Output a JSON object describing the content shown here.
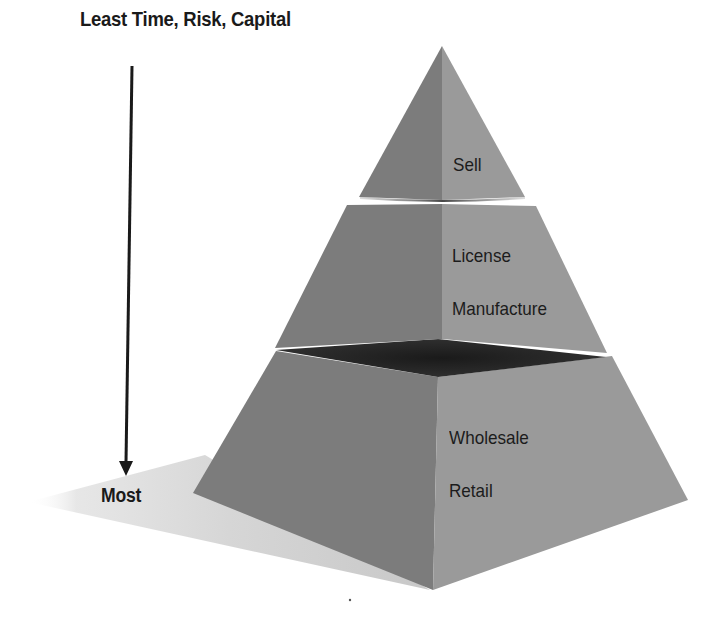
{
  "diagram": {
    "type": "pyramid",
    "axis": {
      "top_label": "Least Time, Risk, Capital",
      "bottom_label": "Most",
      "direction": "down"
    },
    "tiers": [
      {
        "position": "top",
        "labels": [
          "Sell"
        ]
      },
      {
        "position": "middle",
        "labels": [
          "License",
          "Manufacture"
        ]
      },
      {
        "position": "bottom",
        "labels": [
          "Wholesale",
          "Retail"
        ]
      }
    ],
    "colors": {
      "left_face": "#7c7c7c",
      "right_face": "#9a9a9a",
      "slab_top": "#232323",
      "shadow": "#d4d4d4",
      "text": "#1c1c1c",
      "arrow": "#1a1a1a"
    }
  }
}
